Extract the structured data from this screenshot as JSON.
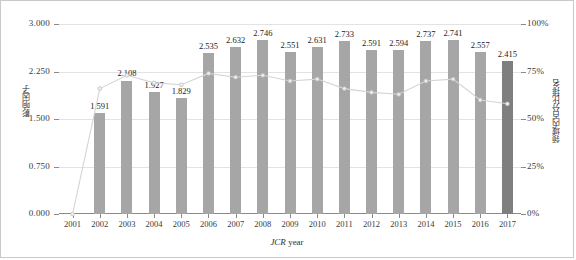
{
  "chart_data": {
    "type": "bar",
    "title": "",
    "xlabel": "JCR year",
    "ylabel": "影响因子",
    "ylabel_right": "领域内百分比排名",
    "categories": [
      "2001",
      "2002",
      "2003",
      "2004",
      "2005",
      "2006",
      "2007",
      "2008",
      "2009",
      "2010",
      "2011",
      "2012",
      "2013",
      "2014",
      "2015",
      "2016",
      "2017"
    ],
    "ylim": [
      0,
      3.0
    ],
    "yticks": [
      "0.000",
      "0.750",
      "1.500",
      "2.250",
      "3.000"
    ],
    "ytick_values": [
      0,
      0.75,
      1.5,
      2.25,
      3.0
    ],
    "ylim_right": [
      0,
      100
    ],
    "yticks_right": [
      "0%",
      "25%",
      "50%",
      "75%",
      "100%"
    ],
    "ytick_values_right": [
      0,
      25,
      50,
      75,
      100
    ],
    "grid": true,
    "legend": "none",
    "series": [
      {
        "name": "影响因子",
        "type": "bar",
        "axis": "left",
        "color": "#a6a6a6",
        "highlight_color": "#7f7f7f",
        "highlight_category": "2017",
        "values": [
          null,
          1.591,
          2.108,
          1.927,
          1.829,
          2.535,
          2.632,
          2.746,
          2.551,
          2.631,
          2.733,
          2.591,
          2.594,
          2.737,
          2.741,
          2.557,
          2.415
        ],
        "labels": [
          "",
          "1.591",
          "2.108",
          "1.927",
          "1.829",
          "2.535",
          "2.632",
          "2.746",
          "2.551",
          "2.631",
          "2.733",
          "2.591",
          "2.594",
          "2.737",
          "2.741",
          "2.557",
          "2.415"
        ]
      },
      {
        "name": "领域内百分比排名",
        "type": "line",
        "axis": "right",
        "color": "#d4d4d4",
        "values": [
          0,
          66,
          73,
          69,
          68,
          74,
          72,
          73,
          70,
          71,
          66,
          64,
          63,
          70,
          71,
          60,
          58
        ]
      }
    ]
  },
  "axes": {
    "left_title": "影响因子",
    "right_title": "领域内百分比排名",
    "x_title_italic": "JCR",
    "x_title_rest": " year"
  }
}
